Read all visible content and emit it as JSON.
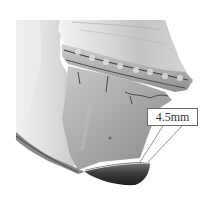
{
  "figure": {
    "measurement": {
      "label": "4.5mm"
    },
    "colors": {
      "background": "#ffffff",
      "bone_light": "#e8e8e8",
      "bone_mid": "#b5b5b5",
      "bone_dark": "#5a5a5a",
      "chin_segment": "#3a3a3a",
      "label_border": "#6a6a6a",
      "label_text": "#333333"
    }
  }
}
